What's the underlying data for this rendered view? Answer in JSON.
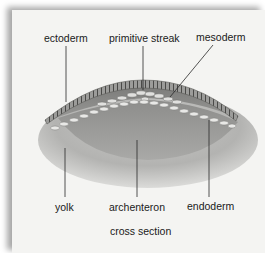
{
  "figure": {
    "caption": "cross section",
    "labels": {
      "ectoderm": "ectoderm",
      "primitive_streak": "primitive streak",
      "mesoderm": "mesoderm",
      "yolk": "yolk",
      "archenteron": "archenteron",
      "endoderm": "endoderm"
    }
  }
}
